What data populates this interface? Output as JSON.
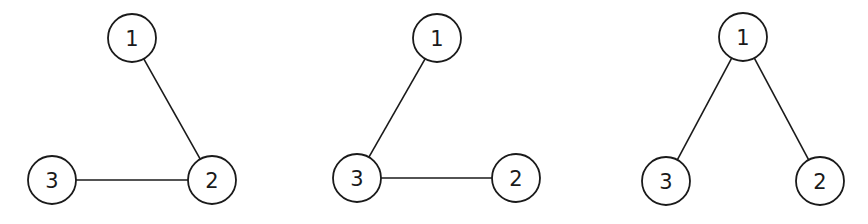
{
  "diagram": {
    "node_radius": 24,
    "stroke_color": "#1a1a1a",
    "background": "#ffffff",
    "panels": [
      {
        "id": "graph-a",
        "nodes": [
          {
            "label": "1",
            "x": 132,
            "y": 38
          },
          {
            "label": "2",
            "x": 212,
            "y": 180
          },
          {
            "label": "3",
            "x": 52,
            "y": 180
          }
        ],
        "edges": [
          [
            "1",
            "2"
          ],
          [
            "3",
            "2"
          ]
        ]
      },
      {
        "id": "graph-b",
        "nodes": [
          {
            "label": "1",
            "x": 437,
            "y": 38
          },
          {
            "label": "2",
            "x": 516,
            "y": 178
          },
          {
            "label": "3",
            "x": 357,
            "y": 178
          }
        ],
        "edges": [
          [
            "1",
            "3"
          ],
          [
            "3",
            "2"
          ]
        ]
      },
      {
        "id": "graph-c",
        "nodes": [
          {
            "label": "1",
            "x": 743,
            "y": 37
          },
          {
            "label": "2",
            "x": 820,
            "y": 181
          },
          {
            "label": "3",
            "x": 666,
            "y": 181
          }
        ],
        "edges": [
          [
            "1",
            "3"
          ],
          [
            "1",
            "2"
          ]
        ]
      }
    ]
  }
}
